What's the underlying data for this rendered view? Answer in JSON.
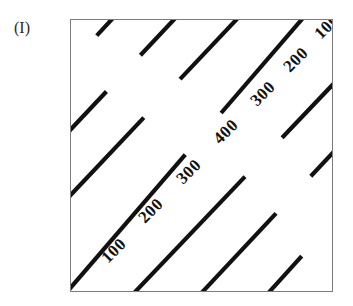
{
  "figure": {
    "panel_label": "(I)",
    "background_color": "#ffffff",
    "frame": {
      "border_color": "#7a7d80",
      "x": 70,
      "y": 19,
      "width": 263,
      "height": 273
    },
    "line_color": "#111111",
    "line_width": 4.2
  },
  "chart_data": {
    "type": "line",
    "title": "(I)",
    "xlabel": "",
    "ylabel": "",
    "grid": false,
    "legend": "none",
    "xlim": [
      0,
      1
    ],
    "ylim": [
      0,
      1
    ],
    "contour_levels": [
      100,
      200,
      300,
      400,
      300,
      200,
      100
    ],
    "contour_orientation_deg": 45,
    "contours": [
      {
        "level": "100",
        "index": 0,
        "x1": -0.285,
        "y1": 0.545,
        "x2": 0.265,
        "y2": 1.115,
        "label_t": 0.56,
        "gap_center_t": 0.58,
        "gap_len": 0.235
      },
      {
        "level": "200",
        "index": 1,
        "x1": -0.285,
        "y1": 0.305,
        "x2": 0.505,
        "y2": 1.115,
        "label_t": 0.595,
        "gap_center_t": 0.615,
        "gap_len": 0.165
      },
      {
        "level": "300",
        "index": 2,
        "x1": -0.285,
        "y1": 0.065,
        "x2": 0.745,
        "y2": 1.115,
        "label_t": 0.6,
        "gap_center_t": 0.615,
        "gap_len": 0.135
      },
      {
        "level": "400",
        "index": 3,
        "x1": -0.115,
        "y1": -0.115,
        "x2": 0.985,
        "y2": 1.115,
        "label_t": 0.555,
        "gap_center_t": 0.565,
        "gap_len": 0.125
      },
      {
        "level": "300",
        "index": 4,
        "x1": 0.135,
        "y1": -0.115,
        "x2": 1.115,
        "y2": 0.875,
        "label_t": 0.6,
        "gap_center_t": 0.615,
        "gap_len": 0.145
      },
      {
        "level": "200",
        "index": 5,
        "x1": 0.395,
        "y1": -0.115,
        "x2": 1.115,
        "y2": 0.625,
        "label_t": 0.62,
        "gap_center_t": 0.635,
        "gap_len": 0.185
      },
      {
        "level": "100",
        "index": 6,
        "x1": 0.655,
        "y1": -0.115,
        "x2": 1.115,
        "y2": 0.375,
        "label_t": 0.615,
        "gap_center_t": 0.635,
        "gap_len": 0.275
      }
    ],
    "labels": [
      {
        "text": "100",
        "x": 0.165,
        "y": 0.155,
        "rotation": -45
      },
      {
        "text": "200",
        "x": 0.305,
        "y": 0.3,
        "rotation": -45
      },
      {
        "text": "300",
        "x": 0.45,
        "y": 0.445,
        "rotation": -45
      },
      {
        "text": "400",
        "x": 0.59,
        "y": 0.59,
        "rotation": -45
      },
      {
        "text": "300",
        "x": 0.73,
        "y": 0.73,
        "rotation": -45
      },
      {
        "text": "200",
        "x": 0.855,
        "y": 0.855,
        "rotation": -45
      },
      {
        "text": "100",
        "x": 0.975,
        "y": 0.975,
        "rotation": -45
      }
    ]
  }
}
